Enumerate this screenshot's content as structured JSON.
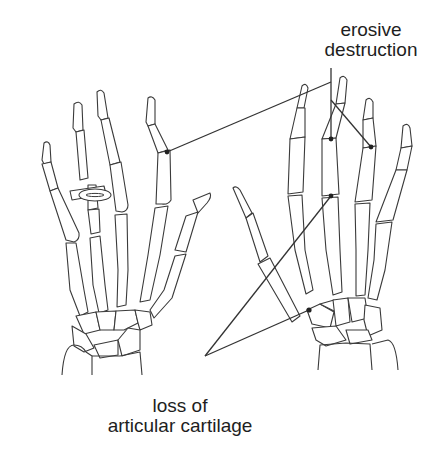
{
  "diagram": {
    "hands": [
      {
        "id": "left-hand",
        "description": "Left hand skeleton (dorsal view) wearing a ring on the ring finger",
        "has_ring": true
      },
      {
        "id": "right-hand",
        "description": "Right hand skeleton (dorsal view)"
      }
    ],
    "annotations": [
      {
        "id": "erosive-destruction",
        "line1": "erosive",
        "line2": "destruction",
        "targets": [
          "left index PIP joint",
          "right middle PIP joint",
          "right ring PIP joint"
        ]
      },
      {
        "id": "loss-of-articular-cartilage",
        "line1": "loss of",
        "line2": "articular cartilage",
        "targets": [
          "right middle MCP joint",
          "right wrist carpal joint"
        ]
      }
    ],
    "colors": {
      "bone_outline": "#3a3a3a",
      "leader_line": "#333333",
      "lesion": "#222222",
      "text": "#1e1e1e",
      "background": "#ffffff"
    }
  }
}
